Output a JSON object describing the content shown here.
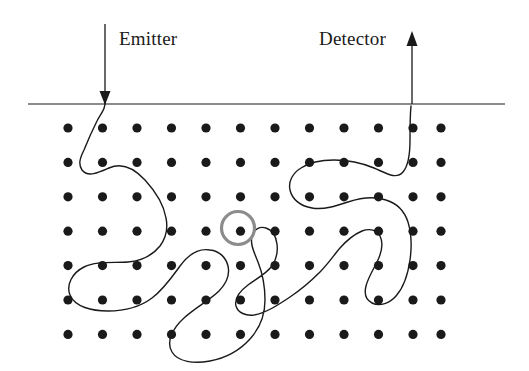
{
  "figure": {
    "width": 529,
    "height": 371,
    "background_color": "#ffffff",
    "ink_color": "#1a1a1a",
    "highlight_color": "#8c8c8c"
  },
  "labels": {
    "emitter": "Emitter",
    "detector": "Detector"
  },
  "surface_line": {
    "name": "sample-surface-line",
    "x1": 28,
    "y1": 104,
    "x2": 505,
    "y2": 104,
    "stroke_width": 1.1,
    "color": "#1a1a1a"
  },
  "emitter_arrow": {
    "name": "emitter-arrow",
    "direction": "down",
    "x": 105,
    "y_start": 24,
    "y_tip": 104,
    "head_width": 11,
    "head_length": 14,
    "color": "#1a1a1a"
  },
  "detector_arrow": {
    "name": "detector-arrow",
    "direction": "up",
    "x": 412,
    "y_start": 104,
    "y_tip": 32,
    "head_width": 11,
    "head_length": 15,
    "color": "#1a1a1a"
  },
  "lattice": {
    "name": "atom-lattice",
    "columns": 11,
    "rows": 7,
    "x_start": 68,
    "y_start": 128,
    "x_spacing": 34.5,
    "y_spacing": 34.4,
    "dot_radius": 4.6,
    "dot_color": "#1a1a1a",
    "column_x": [
      68,
      102.5,
      137,
      171.5,
      206,
      240.5,
      275,
      309.5,
      344,
      378.5,
      413,
      441
    ],
    "row_y": [
      128,
      162.4,
      196.8,
      231.2,
      265.6,
      300,
      334.4
    ]
  },
  "highlight_ring": {
    "name": "scattering-site-highlight",
    "cx": 238,
    "cy": 228,
    "radius": 16.5,
    "stroke_width": 3.2,
    "color": "#8c8c8c"
  },
  "scattering_path": {
    "name": "electron-scattering-path",
    "stroke_width": 1.4,
    "color": "#1a1a1a",
    "fill": "none",
    "description": "Multiple-scattering trajectory entering at the emitter, scattering among lattice atoms, and exiting at the detector.",
    "d": "M 105,100 C 106,110 100,114 97,121 C 92,131 88,140 84,150 C 80,158 78,164 82,170 C 88,178 100,172 109,168 C 122,162 134,168 145,180 C 156,192 164,206 166,218 C 168,228 166,238 160,246 C 152,256 140,261 128,262 C 112,263 96,261 84,267 C 72,273 66,285 70,295 C 75,307 92,311 108,311 C 124,311 140,307 152,298 C 164,289 172,277 180,266 C 188,255 198,248 210,250 C 220,251 226,258 228,266 C 230,275 226,284 219,291 C 210,300 196,307 184,318 C 172,329 166,342 172,352 C 178,362 194,364 210,361 C 226,358 240,350 250,339 C 260,328 265,314 265,300 C 265,286 262,272 258,262 C 254,252 250,244 252,236 C 254,229 260,226 266,228 C 273,230 276,237 277,244 C 278,252 276,260 272,266 C 266,274 256,279 248,285 C 240,291 234,298 236,306 C 238,313 246,316 254,315 C 266,313 278,305 290,297 C 302,289 312,280 320,272 C 328,264 334,255 340,248 C 347,240 355,234 362,231 C 370,228 377,230 380,236 C 384,244 381,254 377,262 C 373,270 368,278 366,286 C 364,294 366,300 372,303 C 380,307 390,303 396,296 C 404,287 408,274 410,260 C 412,246 411,232 408,222 C 404,210 396,203 386,200 C 374,196 360,198 348,202 C 336,206 324,210 312,208 C 300,206 292,199 290,190 C 288,181 293,173 301,168 C 310,162 322,160 334,160 C 348,160 362,163 374,168 C 386,173 396,180 403,172 C 409,165 410,152 410,140 C 410,128 410,116 411,106"
  }
}
